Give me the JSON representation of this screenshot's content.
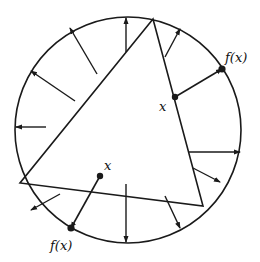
{
  "diagram": {
    "colors": {
      "stroke": "#1a1a1a",
      "background": "#ffffff"
    },
    "labels": {
      "x_right": "x",
      "fx_right": "f(x)",
      "x_bottom": "x",
      "fx_bottom": "f(x)"
    },
    "circle": {
      "cx": 128,
      "cy": 130,
      "r": 113
    },
    "triangle": {
      "vertices": [
        [
          153,
          19
        ],
        [
          20,
          183
        ],
        [
          203,
          206
        ]
      ]
    },
    "arrows": [
      {
        "from": [
          126,
          52
        ],
        "to": [
          126,
          18
        ]
      },
      {
        "from": [
          97,
          74
        ],
        "to": [
          70,
          28
        ]
      },
      {
        "from": [
          75,
          101
        ],
        "to": [
          31,
          71
        ]
      },
      {
        "from": [
          46,
          127
        ],
        "to": [
          16,
          127
        ]
      },
      {
        "from": [
          60,
          194
        ],
        "to": [
          31,
          210
        ]
      },
      {
        "from": [
          126,
          184
        ],
        "to": [
          126,
          242
        ]
      },
      {
        "from": [
          165,
          196
        ],
        "to": [
          180,
          228
        ]
      },
      {
        "from": [
          193,
          168
        ],
        "to": [
          220,
          182
        ]
      },
      {
        "from": [
          188,
          152
        ],
        "to": [
          240,
          152
        ]
      },
      {
        "from": [
          165,
          57
        ],
        "to": [
          180,
          29
        ]
      }
    ],
    "highlighted_maps": [
      {
        "x": [
          175,
          97
        ],
        "fx": [
          222,
          69
        ]
      },
      {
        "x": [
          100,
          176
        ],
        "fx": [
          71,
          228
        ]
      }
    ]
  }
}
